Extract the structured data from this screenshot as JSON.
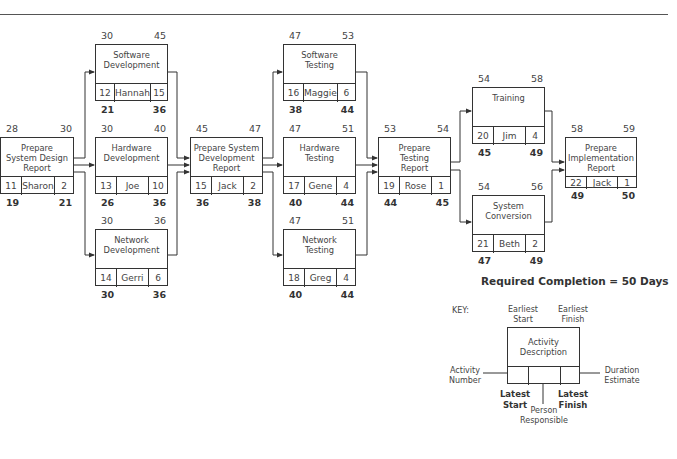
{
  "diagram": {
    "title_rule": true,
    "required_completion": "Required Completion = 50 Days",
    "nodes": [
      {
        "id": "11",
        "desc": "Prepare System Design Report",
        "person": "Sharon",
        "duration": "2",
        "es": "28",
        "ef": "30",
        "ls": "19",
        "lf": "21"
      },
      {
        "id": "12",
        "desc": "Software Development",
        "person": "Hannah",
        "duration": "15",
        "es": "30",
        "ef": "45",
        "ls": "21",
        "lf": "36"
      },
      {
        "id": "13",
        "desc": "Hardware Development",
        "person": "Joe",
        "duration": "10",
        "es": "30",
        "ef": "40",
        "ls": "26",
        "lf": "36"
      },
      {
        "id": "14",
        "desc": "Network Development",
        "person": "Gerri",
        "duration": "6",
        "es": "30",
        "ef": "36",
        "ls": "30",
        "lf": "36"
      },
      {
        "id": "15",
        "desc": "Prepare System Development Report",
        "person": "Jack",
        "duration": "2",
        "es": "45",
        "ef": "47",
        "ls": "36",
        "lf": "38"
      },
      {
        "id": "16",
        "desc": "Software Testing",
        "person": "Maggie",
        "duration": "6",
        "es": "47",
        "ef": "53",
        "ls": "38",
        "lf": "44"
      },
      {
        "id": "17",
        "desc": "Hardware Testing",
        "person": "Gene",
        "duration": "4",
        "es": "47",
        "ef": "51",
        "ls": "40",
        "lf": "44"
      },
      {
        "id": "18",
        "desc": "Network Testing",
        "person": "Greg",
        "duration": "4",
        "es": "47",
        "ef": "51",
        "ls": "40",
        "lf": "44"
      },
      {
        "id": "19",
        "desc": "Prepare Testing Report",
        "person": "Rose",
        "duration": "1",
        "es": "53",
        "ef": "54",
        "ls": "44",
        "lf": "45"
      },
      {
        "id": "20",
        "desc": "Training",
        "person": "Jim",
        "duration": "4",
        "es": "54",
        "ef": "58",
        "ls": "45",
        "lf": "49"
      },
      {
        "id": "21",
        "desc": "System Conversion",
        "person": "Beth",
        "duration": "2",
        "es": "54",
        "ef": "56",
        "ls": "47",
        "lf": "49"
      },
      {
        "id": "22",
        "desc": "Prepare Implementation Report",
        "person": "Jack",
        "duration": "1",
        "es": "58",
        "ef": "59",
        "ls": "49",
        "lf": "50"
      }
    ],
    "desc_lines": {
      "11": [
        "Prepare",
        "System Design",
        "Report"
      ],
      "12": [
        "Software",
        "Development"
      ],
      "13": [
        "Hardware",
        "Development"
      ],
      "14": [
        "Network",
        "Development"
      ],
      "15": [
        "Prepare System",
        "Development",
        "Report"
      ],
      "16": [
        "Software",
        "Testing"
      ],
      "17": [
        "Hardware",
        "Testing"
      ],
      "18": [
        "Network",
        "Testing"
      ],
      "19": [
        "Prepare",
        "Testing",
        "Report"
      ],
      "20": [
        "Training"
      ],
      "21": [
        "System",
        "Conversion"
      ],
      "22": [
        "Prepare",
        "Implementation",
        "Report"
      ]
    },
    "edges": [
      [
        "11",
        "12"
      ],
      [
        "11",
        "13"
      ],
      [
        "11",
        "14"
      ],
      [
        "12",
        "15"
      ],
      [
        "13",
        "15"
      ],
      [
        "14",
        "15"
      ],
      [
        "15",
        "16"
      ],
      [
        "15",
        "17"
      ],
      [
        "15",
        "18"
      ],
      [
        "16",
        "19"
      ],
      [
        "17",
        "19"
      ],
      [
        "18",
        "19"
      ],
      [
        "19",
        "20"
      ],
      [
        "19",
        "21"
      ],
      [
        "20",
        "22"
      ],
      [
        "21",
        "22"
      ]
    ]
  },
  "key": {
    "label": "KEY:",
    "earliest_start": [
      "Earliest",
      "Start"
    ],
    "earliest_finish": [
      "Earliest",
      "Finish"
    ],
    "activity_description": [
      "Activity",
      "Description"
    ],
    "activity_number": [
      "Activity",
      "Number"
    ],
    "duration_estimate": [
      "Duration",
      "Estimate"
    ],
    "latest_start": [
      "Latest",
      "Start"
    ],
    "latest_finish": [
      "Latest",
      "Finish"
    ],
    "person_responsible": [
      "Person",
      "Responsible"
    ]
  }
}
